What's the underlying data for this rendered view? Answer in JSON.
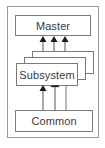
{
  "diagram": {
    "type": "layered-architecture",
    "nodes": {
      "master": {
        "label": "Master"
      },
      "subsystem": {
        "label": "Subsystem",
        "stack_count": 3
      },
      "common": {
        "label": "Common"
      }
    },
    "edges": [
      {
        "from": "subsystem",
        "to": "master",
        "style": "arrow",
        "count": 3
      },
      {
        "from": "common",
        "to": "subsystem",
        "style": "arrow",
        "count": 1
      },
      {
        "from": "common",
        "to": "subsystem",
        "style": "t-bar",
        "count": 1
      },
      {
        "from": "common",
        "to": "subsystem",
        "style": "line",
        "count": 1
      }
    ],
    "colors": {
      "stroke": "#7a7a7a",
      "frame": "#9a9a9a",
      "text": "#3a3a3a",
      "arrowhead": "#1a1a1a"
    }
  }
}
